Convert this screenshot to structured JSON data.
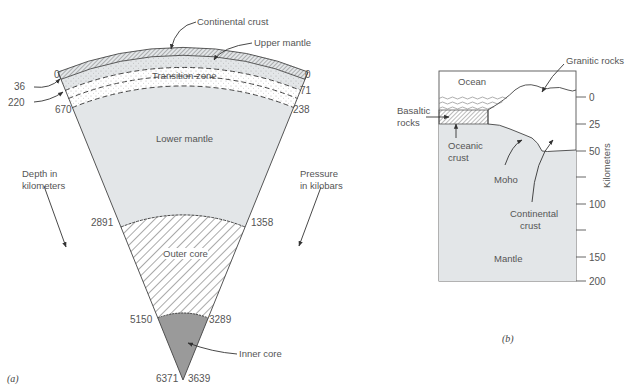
{
  "figure_a": {
    "caption": "(a)",
    "layers": {
      "continental_crust": "Continental crust",
      "upper_mantle": "Upper mantle",
      "transition_zone": "Transition zone",
      "lower_mantle": "Lower mantle",
      "outer_core": "Outer core",
      "inner_core": "Inner core"
    },
    "depth_axis_label_line1": "Depth in",
    "depth_axis_label_line2": "kilometers",
    "pressure_axis_label_line1": "Pressure",
    "pressure_axis_label_line2": "in kilobars",
    "depths_km": [
      "0",
      "36",
      "220",
      "670",
      "2891",
      "5150",
      "6371"
    ],
    "pressures_kbar": [
      "0",
      "71",
      "238",
      "1358",
      "3289",
      "3639"
    ]
  },
  "figure_b": {
    "caption": "(b)",
    "labels": {
      "ocean": "Ocean",
      "granitic_rocks": "Granitic rocks",
      "basaltic_rocks_line1": "Basaltic",
      "basaltic_rocks_line2": "rocks",
      "oceanic_crust_line1": "Oceanic",
      "oceanic_crust_line2": "crust",
      "moho": "Moho",
      "continental_crust_line1": "Continental",
      "continental_crust_line2": "crust",
      "mantle": "Mantle"
    },
    "axis_label": "Kilometers",
    "axis_ticks": [
      "0",
      "25",
      "50",
      "100",
      "150",
      "200"
    ]
  },
  "colors": {
    "mantle_fill": "#e3e6e8",
    "inner_core_fill": "#9a9a9a",
    "line": "#444444",
    "text": "#555555"
  }
}
